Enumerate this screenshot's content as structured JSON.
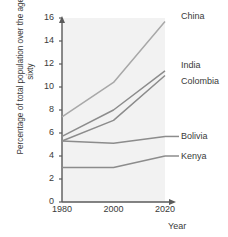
{
  "chart_data": {
    "type": "line",
    "title": "",
    "xlabel": "Year",
    "ylabel": "Percentage of total population over the age of sixty",
    "x": [
      1980,
      2000,
      2020
    ],
    "xticklabels": [
      "1980",
      "2000",
      "2020"
    ],
    "xlim": [
      1980,
      2020
    ],
    "ylim": [
      0,
      16
    ],
    "yticks": [
      0,
      2,
      4,
      6,
      8,
      10,
      12,
      14,
      16
    ],
    "yticklabels": [
      "0",
      "2",
      "4",
      "6",
      "8",
      "10",
      "12",
      "14",
      "16"
    ],
    "grid": false,
    "legend_position": "right-of-plot-inline-labels",
    "series": [
      {
        "name": "China",
        "values": [
          7.4,
          10.4,
          15.7
        ],
        "color": "#a8a8a8"
      },
      {
        "name": "India",
        "values": [
          5.7,
          8.0,
          11.4
        ],
        "color": "#8c8c8c"
      },
      {
        "name": "Colombia",
        "values": [
          5.3,
          7.1,
          11.0
        ],
        "color": "#8c8c8c"
      },
      {
        "name": "Bolivia",
        "values": [
          5.3,
          5.1,
          5.7
        ],
        "color": "#8c8c8c"
      },
      {
        "name": "Kenya",
        "values": [
          3.0,
          3.0,
          4.0
        ],
        "color": "#8c8c8c"
      }
    ]
  },
  "axes": {
    "y_title": "Percentage of total population over the age of sixty",
    "x_title": "Year",
    "y_ticks": [
      "16",
      "14",
      "12",
      "10",
      "8",
      "6",
      "4",
      "2",
      "0"
    ],
    "x_ticks": [
      "1980",
      "2000",
      "2020"
    ]
  },
  "labels": {
    "china": "China",
    "india": "India",
    "colombia": "Colombia",
    "bolivia": "Bolivia",
    "kenya": "Kenya"
  },
  "colors": {
    "plot_background": "#f2f2f2",
    "axis": "#5a5a5a",
    "text": "#3a3a3a",
    "china_line": "#a8a8a8",
    "other_line": "#8c8c8c"
  }
}
